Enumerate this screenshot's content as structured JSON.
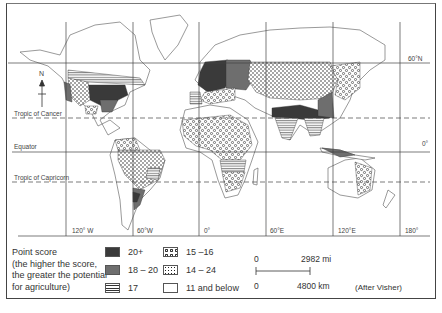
{
  "map": {
    "title": "Agricultural potential point score world map",
    "compass": {
      "label": "N"
    },
    "latitudes": [
      {
        "id": "lat-60n",
        "label": "60°N"
      },
      {
        "id": "tropic-cancer",
        "label": "Tropic of Cancer"
      },
      {
        "id": "equator",
        "label": "Equator",
        "right_label": "0°"
      },
      {
        "id": "tropic-capricorn",
        "label": "Tropic of Capricorn"
      }
    ],
    "longitudes": [
      "120° W",
      "60°W",
      "0°",
      "60°E",
      "120°E",
      "180°"
    ]
  },
  "legend": {
    "title_line1": "Point score",
    "title_line2": "(the higher the score,",
    "title_line3": "the greater the potential",
    "title_line4": "for agriculture)",
    "items": [
      {
        "label": "20+",
        "pattern": "solid-dark",
        "color": "#3a3a3a"
      },
      {
        "label": "18 – 20",
        "pattern": "solid-medium",
        "color": "#6e6e6e"
      },
      {
        "label": "17",
        "pattern": "horizontal-stripes"
      },
      {
        "label": "15 –16",
        "pattern": "circles"
      },
      {
        "label": "14 – 24",
        "pattern": "dots"
      },
      {
        "label": "11 and below",
        "pattern": "blank"
      }
    ]
  },
  "scale_bar": {
    "top_zero": "0",
    "top_value": "2982 mi",
    "bottom_zero": "0",
    "bottom_value": "4800 km"
  },
  "credit": "(After Visher)"
}
